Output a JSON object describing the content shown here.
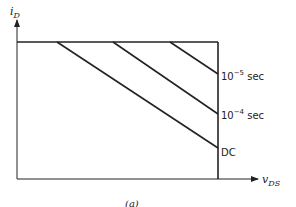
{
  "figure": {
    "caption": "(a)",
    "y_axis": {
      "label": "i",
      "subscript": "D"
    },
    "x_axis": {
      "label": "v",
      "subscript": "DS"
    },
    "colors": {
      "line": "#222222",
      "background": "#ffffff"
    }
  },
  "curves": [
    {
      "label_base": "10",
      "label_exp": "−5",
      "label_unit": " sec",
      "label_text": "10^-5 sec"
    },
    {
      "label_base": "10",
      "label_exp": "−4",
      "label_unit": " sec",
      "label_text": "10^-4 sec"
    },
    {
      "label_base": "DC",
      "label_exp": "",
      "label_unit": "",
      "label_text": "DC"
    }
  ]
}
